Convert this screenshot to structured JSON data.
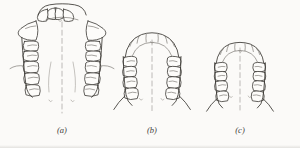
{
  "figure": {
    "background_color": "#fbfaf8",
    "ink_color": "#3a3733",
    "panels": [
      {
        "id": "a",
        "caption": "(a)",
        "name": "dental-arch-panel-a",
        "description": "Wide V-shaped maxillary arch with large flaring canines",
        "arch_shape": "V-shaped / flared",
        "tooth_count": 16
      },
      {
        "id": "b",
        "caption": "(b)",
        "name": "dental-arch-panel-b",
        "description": "Rounded parabolic maxillary arch",
        "arch_shape": "parabolic",
        "tooth_count": 16
      },
      {
        "id": "c",
        "caption": "(c)",
        "name": "dental-arch-panel-c",
        "description": "Narrow rounded maxillary arch",
        "arch_shape": "narrow parabolic",
        "tooth_count": 16
      }
    ]
  }
}
